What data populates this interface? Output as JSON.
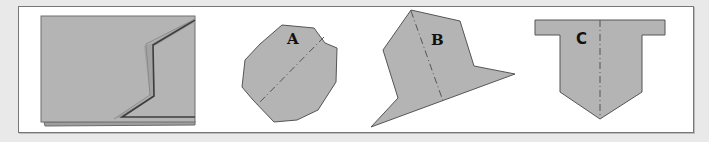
{
  "figure": {
    "background": "#e9e9e9",
    "frame_color": "#ffffff",
    "shape_fill": "#b4b4b4",
    "shape_stroke": "#555555",
    "fold_line_color": "#555555"
  },
  "panels": [
    {
      "id": "folded-sheet",
      "label": "",
      "description": "Rectangular sheet shown with a zig-zag fold"
    },
    {
      "id": "A",
      "label": "A",
      "description": "Irregular octagon with diagonal dash-dot fold line"
    },
    {
      "id": "B",
      "label": "B",
      "description": "Irregular pointed polygon with dash-dot fold line"
    },
    {
      "id": "C",
      "label": "C",
      "description": "T-shaped pentagon with vertical dashed fold line"
    }
  ]
}
